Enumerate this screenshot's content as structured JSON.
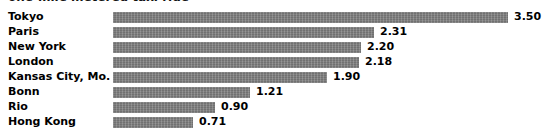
{
  "chart_data": {
    "type": "bar",
    "orientation": "horizontal",
    "title": "one-mile metered taxi ride",
    "title_visibility": "cropped-at-top-edge",
    "categories": [
      "Tokyo",
      "Paris",
      "New York",
      "London",
      "Kansas City, Mo.",
      "Bonn",
      "Rio",
      "Hong Kong"
    ],
    "values": [
      3.5,
      2.31,
      2.2,
      2.18,
      1.9,
      1.21,
      0.9,
      0.71
    ],
    "value_labels": [
      "3.50",
      "2.31",
      "2.20",
      "2.18",
      "1.90",
      "1.21",
      "0.90",
      "0.71"
    ],
    "xlabel": "",
    "ylabel": "",
    "xlim": [
      0,
      3.5
    ],
    "grid": false,
    "legend": null,
    "bar_color": "#808080",
    "background_color": "#ffffff",
    "text_color": "#000000"
  },
  "chart": {
    "rows": [
      {
        "label": "Tokyo",
        "value": 3.5,
        "value_label": "3.50"
      },
      {
        "label": "Paris",
        "value": 2.31,
        "value_label": "2.31"
      },
      {
        "label": "New York",
        "value": 2.2,
        "value_label": "2.20"
      },
      {
        "label": "London",
        "value": 2.18,
        "value_label": "2.18"
      },
      {
        "label": "Kansas City, Mo.",
        "value": 1.9,
        "value_label": "1.90"
      },
      {
        "label": "Bonn",
        "value": 1.21,
        "value_label": "1.21"
      },
      {
        "label": "Rio",
        "value": 0.9,
        "value_label": "0.90"
      },
      {
        "label": "Hong Kong",
        "value": 0.71,
        "value_label": "0.71"
      }
    ],
    "title": "one-mile metered taxi ride",
    "max_value": 3.5,
    "track_width_px": 395
  }
}
